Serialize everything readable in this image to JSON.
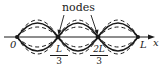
{
  "figure": {
    "title_label": "nodes",
    "axis_label": "x",
    "origin_label": "0",
    "end_label": "L",
    "node_labels": [
      {
        "numerator": "L",
        "denominator": "3"
      },
      {
        "numerator": "2L",
        "denominator": "3"
      }
    ],
    "curves": {
      "solid_amplitude_px": 14,
      "dashed_amplitudes_px": [
        10,
        17
      ]
    },
    "colors": {
      "ink": "#1a1a1a",
      "background": "#ffffff"
    }
  }
}
